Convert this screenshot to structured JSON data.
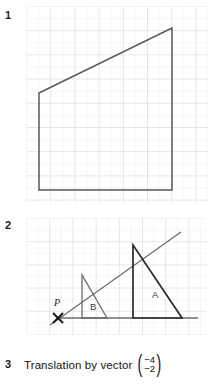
{
  "page": {
    "background": "#ffffff",
    "width": 214,
    "height": 385
  },
  "colors": {
    "grid_minor": "#e9eaec",
    "grid_major": "#d2d4d8",
    "shape_stroke": "#5a5a5a",
    "dark_stroke": "#2b2b2b",
    "text": "#141414"
  },
  "items": [
    {
      "number": "1",
      "type": "grid-figure"
    },
    {
      "number": "2",
      "type": "grid-figure"
    },
    {
      "number": "3",
      "type": "text"
    }
  ],
  "figure1": {
    "label": "1",
    "description": "Quadrilateral drawn on a square grid",
    "grid": {
      "cell": 12.1,
      "major_every": 2,
      "cols": 15,
      "rows": 16
    },
    "shape": {
      "name": "quadrilateral",
      "stroke": "#5a5a5a",
      "fill": "none",
      "vertices_px": [
        [
          13,
          87
        ],
        [
          146,
          22
        ],
        [
          146,
          184
        ],
        [
          13,
          184
        ]
      ]
    }
  },
  "figure2": {
    "label": "2",
    "description": "Enlargement of triangle B to triangle A from centre of enlargement P",
    "grid": {
      "cell": 11.6,
      "major_every": 2,
      "cols": 15,
      "rows": 10
    },
    "centre": {
      "label": "P",
      "marker": "x-cross",
      "x_px": 32,
      "y_px": 100
    },
    "ray": {
      "from_px": [
        24,
        107
      ],
      "to_px": [
        152,
        16
      ]
    },
    "baseline": {
      "from_px": [
        30,
        100
      ],
      "to_px": [
        172,
        100
      ]
    },
    "triangles": [
      {
        "label": "B",
        "stroke": "#6b6b6b",
        "vertices_px": [
          [
            56,
            100
          ],
          [
            81,
            100
          ],
          [
            56,
            57
          ]
        ],
        "label_pos_px": [
          64,
          90
        ]
      },
      {
        "label": "A",
        "stroke": "#2b2b2b",
        "vertices_px": [
          [
            107,
            100
          ],
          [
            156,
            100
          ],
          [
            107,
            27
          ]
        ],
        "label_pos_px": [
          128,
          78
        ]
      }
    ]
  },
  "item3": {
    "number": "3",
    "text": "Translation by vector",
    "vector": {
      "open_paren": "(",
      "close_paren": ")",
      "x": "−4",
      "y": "−2"
    }
  }
}
